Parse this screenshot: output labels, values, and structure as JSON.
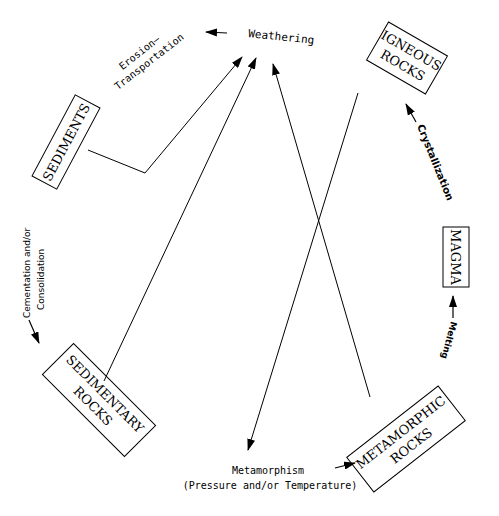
{
  "diagram": {
    "nodes": {
      "igneous": {
        "line1": "IGNEOUS",
        "line2": "ROCKS"
      },
      "magma": {
        "label": "MAGMA"
      },
      "metamorphic": {
        "line1": "METAMORPHIC",
        "line2": "ROCKS"
      },
      "sedimentary": {
        "line1": "SEDIMENTARY",
        "line2": "ROCKS"
      },
      "sediments": {
        "label": "SEDIMENTS"
      }
    },
    "processes": {
      "weathering": "Weathering",
      "erosion_line1": "Erosion—",
      "erosion_line2": "Transportation",
      "crystallization": "Crystallization",
      "melting": "Melting",
      "metamorphism_line1": "Metamorphism",
      "metamorphism_line2": "(Pressure and/or Temperature)",
      "cementation_line1": "Cementation and/or",
      "cementation_line2": "Consolidation"
    },
    "colors": {
      "stroke": "#000000",
      "background": "#ffffff"
    }
  }
}
